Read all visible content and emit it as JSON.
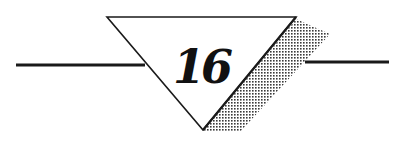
{
  "chapter": {
    "number": "16"
  },
  "colors": {
    "ink": "#1a1a1a",
    "background": "#ffffff",
    "shadow_dot": "#3a3a3a"
  }
}
